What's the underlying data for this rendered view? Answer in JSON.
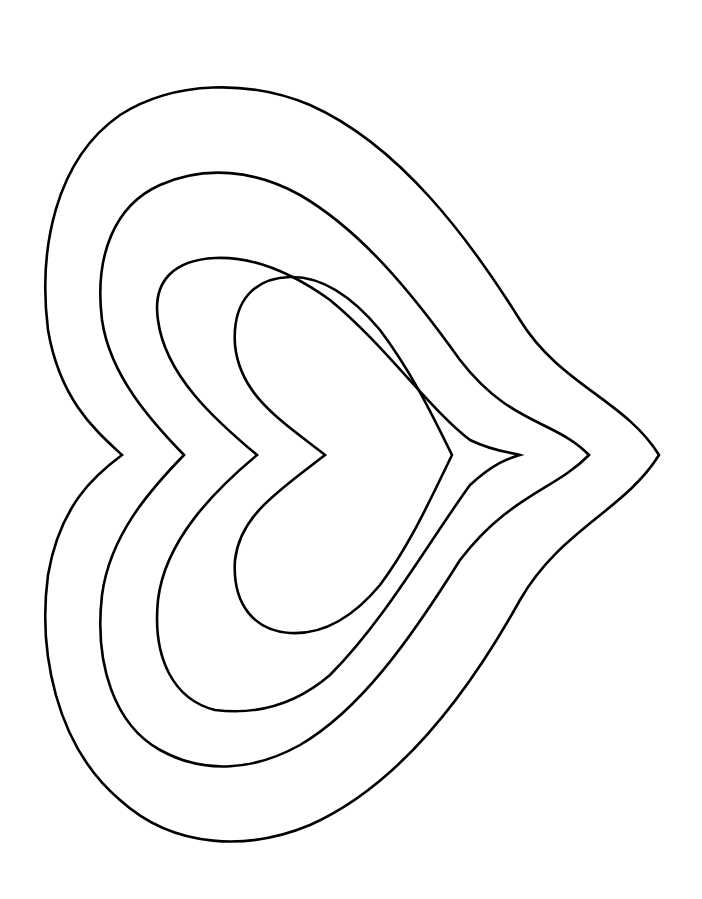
{
  "artwork": {
    "title": "Nested hearts outline",
    "background_color": "#ffffff",
    "stroke_color": "#000000",
    "orientation": "pointing-right",
    "heart_count": 4,
    "hearts": [
      {
        "name": "outer",
        "cleft": [
          122,
          455
        ],
        "tip": [
          659,
          455
        ],
        "d": "M122,455 C95,430 60,400 48,330 C38,250 55,160 120,115 C175,80 250,80 310,105 C400,145 470,240 520,320 C560,385 625,400 659,455 C625,510 560,530 520,600 C470,690 400,785 310,825 C250,850 175,850 120,800 C55,745 38,650 48,575 C60,505 95,475 122,455 Z"
      },
      {
        "name": "second",
        "cleft": [
          184,
          455
        ],
        "tip": [
          589,
          455
        ],
        "d": "M184,455 C150,420 110,375 102,320 C94,255 115,205 160,185 C205,165 255,170 300,195 C360,230 410,290 460,360 C510,425 555,420 589,455 C555,490 510,495 460,560 C410,640 360,710 300,745 C255,770 205,775 160,750 C115,725 94,665 102,595 C110,535 150,490 184,455 Z"
      },
      {
        "name": "third",
        "cleft": [
          257,
          455
        ],
        "tip": [
          520,
          455
        ],
        "d": "M257,455 C215,420 165,375 158,320 C152,280 175,260 215,258 C255,256 295,275 330,300 C385,345 430,410 470,440 C495,452 510,452 520,455 C510,458 495,462 470,485 C430,540 385,620 330,675 C295,705 255,715 215,710 C175,700 152,660 158,600 C165,540 215,490 257,455 Z"
      },
      {
        "name": "inner",
        "cleft": [
          325,
          455
        ],
        "tip": [
          452,
          455
        ],
        "d": "M325,455 C280,420 240,395 235,345 C232,300 255,278 290,277 C325,276 355,300 380,330 C410,370 430,410 452,455 C430,500 410,545 380,585 C355,615 325,635 290,633 C255,631 232,605 235,560 C240,515 280,490 325,455 Z"
      }
    ]
  }
}
